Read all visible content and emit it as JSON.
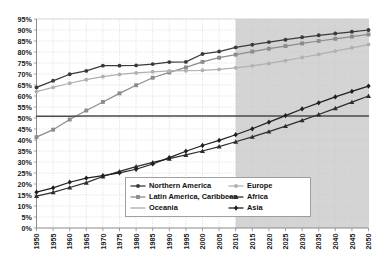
{
  "chart_data": {
    "type": "line",
    "title": "",
    "subtitle": "",
    "xlabel": "",
    "ylabel": "",
    "x": [
      1950,
      1955,
      1960,
      1965,
      1970,
      1975,
      1980,
      1985,
      1990,
      1995,
      2000,
      2005,
      2010,
      2015,
      2020,
      2025,
      2030,
      2035,
      2040,
      2045,
      2050
    ],
    "xlim": [
      1950,
      2050
    ],
    "ylim": [
      0,
      95
    ],
    "ytick_values": [
      0,
      5,
      10,
      15,
      20,
      25,
      30,
      35,
      40,
      45,
      50,
      55,
      60,
      65,
      70,
      75,
      80,
      85,
      90,
      95
    ],
    "ytick_labels": [
      "0%",
      "5%",
      "10%",
      "15%",
      "20%",
      "25%",
      "30%",
      "35%",
      "40%",
      "45%",
      "50%",
      "55%",
      "60%",
      "65%",
      "70%",
      "75%",
      "80%",
      "85%",
      "90%",
      "95%"
    ],
    "xtick_labels": [
      "1950",
      "1955",
      "1960",
      "1965",
      "1970",
      "1975",
      "1980",
      "1985",
      "1990",
      "1995",
      "2000",
      "2005",
      "2010",
      "2015",
      "2020",
      "2025",
      "2030",
      "2035",
      "2040",
      "2045",
      "2050"
    ],
    "grid": true,
    "grid_style": "dotted-horizontal-and-vertical",
    "legend_position": "inside-bottom-center",
    "projection_shading": {
      "label": "",
      "start_year": 2010,
      "end_year": 2050,
      "color": "#d4d4d4"
    },
    "series": [
      {
        "name": "Northern America",
        "color": "#3a3a3a",
        "marker": "circle",
        "values": [
          63.9,
          66.9,
          69.9,
          71.4,
          73.8,
          73.8,
          73.9,
          74.5,
          75.4,
          75.5,
          79.1,
          80.2,
          82.1,
          83.3,
          84.5,
          85.6,
          86.7,
          87.6,
          88.4,
          89.2,
          90.0
        ]
      },
      {
        "name": "Latin America, Caribbean",
        "color": "#8c8c8c",
        "marker": "square",
        "values": [
          41.3,
          44.7,
          49.3,
          53.4,
          57.3,
          61.2,
          64.9,
          68.3,
          70.7,
          73.0,
          75.5,
          77.4,
          78.8,
          80.2,
          81.5,
          82.7,
          83.9,
          85.0,
          86.0,
          87.0,
          88.0
        ]
      },
      {
        "name": "Oceania",
        "color": "#4a4a4a",
        "marker": "none",
        "values": [
          50.8,
          50.8,
          50.8,
          50.9,
          50.9,
          50.9,
          50.9,
          50.9,
          50.9,
          50.9,
          50.9,
          50.9,
          50.9,
          50.9,
          50.9,
          50.9,
          50.9,
          50.9,
          50.9,
          50.9,
          50.9
        ]
      },
      {
        "name": "Europe",
        "color": "#b0b0b0",
        "marker": "circle",
        "values": [
          62.0,
          63.9,
          65.8,
          67.4,
          68.8,
          69.8,
          70.5,
          71.0,
          71.4,
          71.5,
          71.7,
          72.1,
          72.8,
          73.7,
          74.8,
          76.1,
          77.5,
          78.9,
          80.4,
          81.9,
          83.4
        ]
      },
      {
        "name": "Africa",
        "color": "#2e2e2e",
        "marker": "triangle",
        "values": [
          14.5,
          16.2,
          18.4,
          20.6,
          23.4,
          25.7,
          27.9,
          29.8,
          31.5,
          33.2,
          35.0,
          37.0,
          39.2,
          41.4,
          43.8,
          46.3,
          48.9,
          51.6,
          54.4,
          57.2,
          60.0
        ]
      },
      {
        "name": "Asia",
        "color": "#1f1f1f",
        "marker": "diamond",
        "values": [
          16.3,
          18.2,
          20.8,
          22.7,
          23.8,
          25.1,
          26.7,
          29.1,
          32.0,
          34.9,
          37.5,
          39.8,
          42.4,
          45.1,
          48.1,
          51.1,
          54.1,
          56.9,
          59.6,
          62.1,
          64.5
        ]
      }
    ],
    "legend": [
      {
        "name": "Northern America",
        "color": "#3a3a3a",
        "marker": "circle",
        "column": 0,
        "row": 0
      },
      {
        "name": "Latin America, Caribbean",
        "color": "#8c8c8c",
        "marker": "square",
        "column": 0,
        "row": 1
      },
      {
        "name": "Oceania",
        "color": "#b8b8b8",
        "marker": "none",
        "column": 0,
        "row": 2
      },
      {
        "name": "Europe",
        "color": "#b0b0b0",
        "marker": "circle",
        "column": 1,
        "row": 0
      },
      {
        "name": "Africa",
        "color": "#2e2e2e",
        "marker": "triangle",
        "column": 1,
        "row": 1
      },
      {
        "name": "Asia",
        "color": "#1f1f1f",
        "marker": "diamond",
        "column": 1,
        "row": 2
      }
    ]
  },
  "colors": {
    "background": "#ffffff",
    "plot_background": "#ffffff",
    "axis": "#8a8a8a",
    "gridline": "#c9c9c9",
    "tick_text": "#1a1a1a",
    "legend_border": "#8a8a8a",
    "legend_background": "#ffffff",
    "shaded_region": "#d4d4d4"
  }
}
